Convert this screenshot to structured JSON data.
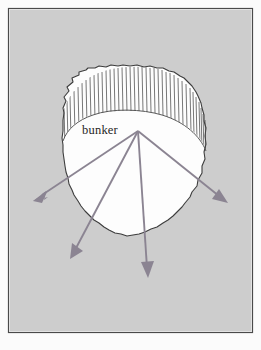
{
  "figure": {
    "caption": "",
    "frame": {
      "x": 8,
      "y": 8,
      "width": 245,
      "height": 325,
      "border_color": "#4a4a4a",
      "fill_color": "#cdcdcd",
      "page_color": "#fbfbfb"
    },
    "colors": {
      "background_gray": "#cdcdcd",
      "blob_fill": "#fdfdfd",
      "blob_outline": "#3d3d3d",
      "hatch_line": "#4a4a4a",
      "arrow": "#8b8492",
      "label": "#262626"
    },
    "labels": [
      {
        "name": "bunker-label",
        "text": "bunker",
        "x": 100,
        "y": 133
      }
    ],
    "blob": {
      "name": "crater-outline",
      "center_x": 134,
      "top_y": 68,
      "bottom_y": 236,
      "left_x": 62,
      "right_x": 206
    },
    "hatched_rim": {
      "name": "rim-hatching",
      "tick_count": 40,
      "description": "vertical hatch ticks between outer and inner rim arcs"
    },
    "arrows": [
      {
        "name": "arrow-left",
        "from_x": 138,
        "from_y": 131,
        "to_x": 33,
        "to_y": 201
      },
      {
        "name": "arrow-lower-left",
        "from_x": 138,
        "from_y": 131,
        "to_x": 70,
        "to_y": 259
      },
      {
        "name": "arrow-down",
        "from_x": 138,
        "from_y": 131,
        "to_x": 148,
        "to_y": 278
      },
      {
        "name": "arrow-right",
        "from_x": 138,
        "from_y": 131,
        "to_x": 228,
        "to_y": 203
      }
    ]
  }
}
